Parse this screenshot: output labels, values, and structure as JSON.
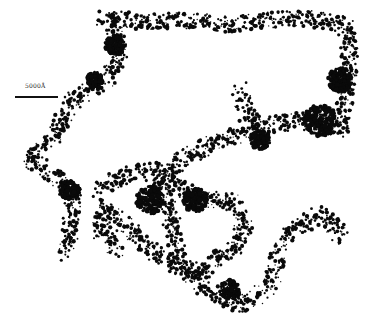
{
  "figure": {
    "type": "micrograph",
    "colors": {
      "background": "#ffffff",
      "aggregate": "#0a0a0a"
    },
    "scale_bar": {
      "label": "5000Å"
    }
  }
}
